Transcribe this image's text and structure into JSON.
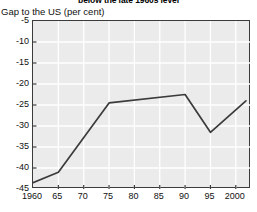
{
  "headline": "below the late 1960s level",
  "axis_caption": "Gap to the US (per cent)",
  "chart_data": {
    "type": "line",
    "title": "below the late 1960s level",
    "subtitle": "",
    "xlabel": "",
    "ylabel": "Gap to the US (per cent)",
    "xlim": [
      1960,
      2003
    ],
    "ylim": [
      -45,
      -5
    ],
    "grid": true,
    "legend": false,
    "legend_position": "none",
    "line_color": "#3b3b3b",
    "plot_background": "#ebebeb",
    "gridline_color": "#ffffff",
    "x_tick_labels": [
      "1960",
      "65",
      "70",
      "75",
      "80",
      "85",
      "90",
      "95",
      "2000"
    ],
    "x_tick_values": [
      1960,
      1965,
      1970,
      1975,
      1980,
      1985,
      1990,
      1995,
      2000
    ],
    "y_tick_labels": [
      "-5",
      "-10",
      "-15",
      "-20",
      "-25",
      "-30",
      "-35",
      "-40",
      "-45"
    ],
    "y_tick_values": [
      -5,
      -10,
      -15,
      -20,
      -25,
      -30,
      -35,
      -40,
      -45
    ],
    "series": [
      {
        "name": "Gap to the US",
        "x": [
          1960,
          1965,
          1975,
          1990,
          1995,
          2002
        ],
        "values": [
          -43.5,
          -41.0,
          -24.5,
          -22.5,
          -31.5,
          -24.0
        ]
      }
    ]
  }
}
